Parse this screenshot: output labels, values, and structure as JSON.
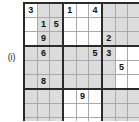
{
  "label": {
    "text": "(i)",
    "right_marker": ":"
  },
  "grid": {
    "size": 9,
    "box_rows": 3,
    "box_cols": 3,
    "line_color": "#a9a9ad",
    "block_line_color": "#2b2b2b",
    "shade_color": "#dcdcdc",
    "digit_color": "#111111",
    "rows": [
      [
        "3",
        "",
        "",
        "1",
        "",
        "4",
        "",
        "",
        ""
      ],
      [
        "",
        "1",
        "5",
        "",
        "",
        "",
        "",
        "",
        ""
      ],
      [
        "",
        "9",
        "",
        "",
        "",
        "",
        "2",
        "",
        ""
      ],
      [
        "",
        "6",
        "",
        "",
        "",
        "5",
        "3",
        "",
        ""
      ],
      [
        "",
        "",
        "",
        "",
        "",
        "",
        "",
        "5",
        ""
      ],
      [
        "",
        "8",
        "",
        "",
        "",
        "",
        "",
        "",
        ""
      ],
      [
        "",
        "",
        "",
        "",
        "9",
        "",
        "",
        "",
        ""
      ],
      [
        "",
        "",
        "",
        "",
        "",
        "",
        "",
        "",
        ""
      ],
      [
        "",
        "",
        "",
        "",
        "",
        "7",
        "9",
        "",
        ""
      ]
    ],
    "shaded": [
      [
        0,
        1,
        1,
        0,
        0,
        0,
        1,
        1,
        1
      ],
      [
        0,
        1,
        1,
        0,
        0,
        0,
        1,
        1,
        1
      ],
      [
        0,
        1,
        1,
        0,
        0,
        0,
        1,
        1,
        1
      ],
      [
        1,
        1,
        1,
        1,
        1,
        1,
        1,
        0,
        0
      ],
      [
        1,
        1,
        1,
        1,
        1,
        1,
        1,
        0,
        0
      ],
      [
        1,
        1,
        1,
        1,
        1,
        1,
        1,
        0,
        0
      ],
      [
        1,
        1,
        1,
        0,
        0,
        0,
        1,
        1,
        1
      ],
      [
        1,
        1,
        1,
        0,
        0,
        0,
        1,
        1,
        1
      ],
      [
        1,
        1,
        1,
        0,
        0,
        0,
        1,
        1,
        1
      ]
    ]
  }
}
